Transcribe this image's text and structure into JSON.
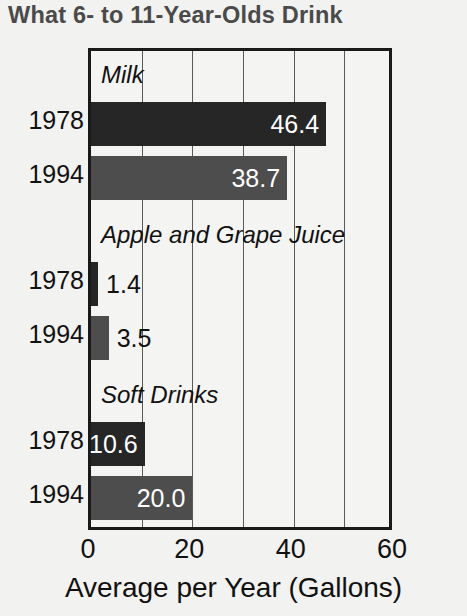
{
  "chart_data": {
    "type": "bar",
    "orientation": "horizontal",
    "title": "What 6- to 11-Year-Olds Drink",
    "xlabel": "Average per Year (Gallons)",
    "ylabel": "",
    "xlim": [
      0,
      60
    ],
    "xticks": [
      0,
      20,
      40,
      60
    ],
    "gridlines": [
      10,
      20,
      30,
      40,
      50
    ],
    "grid": true,
    "legend": "none",
    "series": [
      {
        "name": "1978",
        "color": "#262626",
        "values": [
          46.4,
          1.4,
          10.6
        ]
      },
      {
        "name": "1994",
        "color": "#4d4d4d",
        "values": [
          38.7,
          3.5,
          20.0
        ]
      }
    ],
    "categories": [
      "Milk",
      "Apple and Grape Juice",
      "Soft Drinks"
    ],
    "groups": [
      {
        "label": "Milk",
        "bars": [
          {
            "year": "1978",
            "value": 46.4,
            "value_label": "46.4",
            "shade": "dark",
            "label_position": "inside"
          },
          {
            "year": "1994",
            "value": 38.7,
            "value_label": "38.7",
            "shade": "light",
            "label_position": "inside"
          }
        ]
      },
      {
        "label": "Apple and Grape Juice",
        "bars": [
          {
            "year": "1978",
            "value": 1.4,
            "value_label": "1.4",
            "shade": "dark",
            "label_position": "outside"
          },
          {
            "year": "1994",
            "value": 3.5,
            "value_label": "3.5",
            "shade": "light",
            "label_position": "outside"
          }
        ]
      },
      {
        "label": "Soft Drinks",
        "bars": [
          {
            "year": "1978",
            "value": 10.6,
            "value_label": "10.6",
            "shade": "dark",
            "label_position": "inside"
          },
          {
            "year": "1994",
            "value": 20.0,
            "value_label": "20.0",
            "shade": "light",
            "label_position": "inside"
          }
        ]
      }
    ]
  },
  "colors": {
    "background": "#f2f2f0",
    "plot_background": "#f4f4f2",
    "axis": "#1a1a1a",
    "gridline": "#5a5a5a",
    "title": "#4a4a4a",
    "text": "#111111",
    "bar_1978": "#262626",
    "bar_1994": "#4d4d4d",
    "value_inside": "#ffffff"
  },
  "xticks_labels": [
    "0",
    "20",
    "40",
    "60"
  ]
}
